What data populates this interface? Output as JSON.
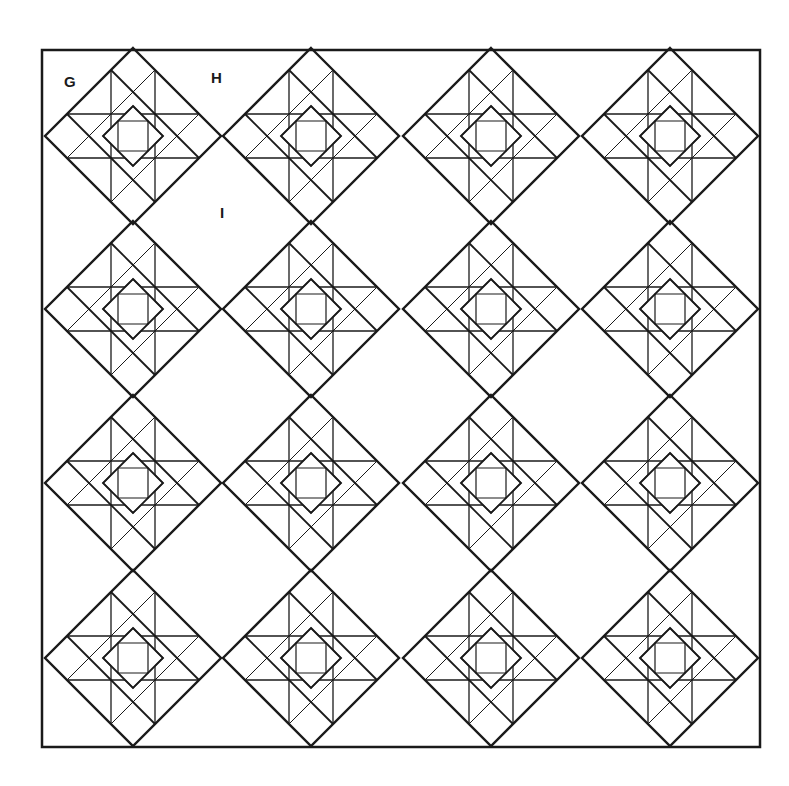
{
  "diagram": {
    "type": "quilt-layout",
    "frame": {
      "x": 42,
      "y": 50,
      "width": 718,
      "height": 697
    },
    "colors": {
      "line": "#1a1a1a",
      "background": "#ffffff"
    },
    "block": {
      "half_diagonal": 88
    },
    "block_centers": {
      "columns_x": [
        133,
        311,
        491,
        670
      ],
      "rows_y": [
        136,
        309,
        483,
        658
      ]
    },
    "labels": [
      {
        "text": "G",
        "x": 64,
        "y": 73
      },
      {
        "text": "H",
        "x": 211,
        "y": 69
      },
      {
        "text": "I",
        "x": 220,
        "y": 204
      }
    ]
  }
}
